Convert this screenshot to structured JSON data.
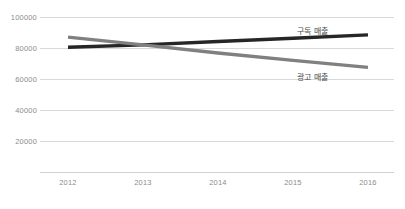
{
  "chart_data": {
    "type": "line",
    "title": "",
    "subtitle": "",
    "xlabel": "",
    "ylabel": "",
    "categories": [
      "2012",
      "2013",
      "2014",
      "2015",
      "2016"
    ],
    "ylim": [
      0,
      100000
    ],
    "yticks": [
      "20000",
      "40000",
      "60000",
      "80000",
      "100000"
    ],
    "ytick_values": [
      20000,
      40000,
      60000,
      80000,
      100000
    ],
    "grid": true,
    "legend_position": "inline-labels",
    "series": [
      {
        "name": "구독 매출",
        "color": "#262626",
        "values": [
          80500,
          82000,
          84200,
          86300,
          88500
        ]
      },
      {
        "name": "광고 매출",
        "color": "#808080",
        "values": [
          87000,
          82000,
          76800,
          72000,
          67500
        ]
      }
    ],
    "annotations": [
      {
        "text": "구독 매출",
        "series": "구독 매출"
      },
      {
        "text": "광고 매출",
        "series": "광고 매출"
      }
    ]
  },
  "axis": {
    "y_labels": [
      "100000",
      "80000",
      "60000",
      "40000",
      "20000"
    ],
    "x_labels": [
      "2012",
      "2013",
      "2014",
      "2015",
      "2016"
    ]
  },
  "colors": {
    "background": "#ffffff",
    "gridline": "#d9d9d9",
    "axis_line": "#d0d0d0",
    "tick_text": "#8c8c8c",
    "label_text": "#4a4a4a",
    "series_dark": "#262626",
    "series_gray": "#808080"
  }
}
